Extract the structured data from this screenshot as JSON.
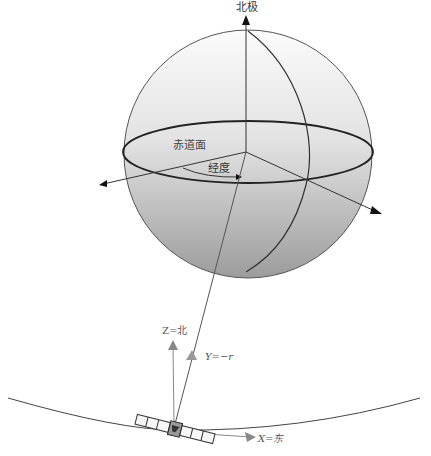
{
  "diagram": {
    "labels": {
      "north_pole": "北极",
      "equatorial_plane": "赤道面",
      "longitude": "经度",
      "z_axis": "Z=北",
      "y_axis": "Y=−r",
      "x_axis": "X=东"
    },
    "colors": {
      "line": "#333333",
      "sphere_top": "#f4f4f4",
      "sphere_bottom": "#9a9a9a",
      "arrow_gray": "#888888"
    }
  }
}
